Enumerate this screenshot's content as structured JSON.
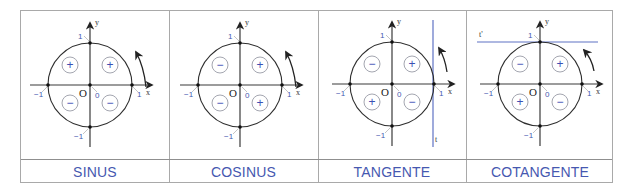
{
  "panels": [
    {
      "label": "SINUS",
      "signs": {
        "top_left": "+",
        "top_right": "+",
        "bottom_left": "−",
        "bottom_right": "−"
      },
      "axis_labels": {
        "x": "x",
        "y": "y",
        "origin": "O",
        "zero": "0",
        "x_pos": "1",
        "x_neg": "−1",
        "y_pos": "1",
        "y_neg": "−1"
      },
      "auxiliary_line": null
    },
    {
      "label": "COSINUS",
      "signs": {
        "top_left": "−",
        "top_right": "+",
        "bottom_left": "−",
        "bottom_right": "+"
      },
      "axis_labels": {
        "x": "x",
        "y": "y",
        "origin": "O",
        "zero": "0",
        "x_pos": "1",
        "x_neg": "−1",
        "y_pos": "1",
        "y_neg": "−1"
      },
      "auxiliary_line": null
    },
    {
      "label": "TANGENTE",
      "signs": {
        "top_left": "−",
        "top_right": "+",
        "bottom_left": "+",
        "bottom_right": "−"
      },
      "axis_labels": {
        "x": "x",
        "y": "y",
        "origin": "O",
        "zero": "0",
        "x_pos": "1",
        "x_neg": "−1",
        "y_pos": "1",
        "y_neg": "−1"
      },
      "auxiliary_line": {
        "name": "t",
        "orientation": "vertical",
        "position": "x=1"
      }
    },
    {
      "label": "COTANGENTE",
      "signs": {
        "top_left": "−",
        "top_right": "+",
        "bottom_left": "+",
        "bottom_right": "−"
      },
      "axis_labels": {
        "x": "x",
        "y": "y",
        "origin": "O",
        "zero": "0",
        "x_pos": "1",
        "x_neg": "−1",
        "y_pos": "1",
        "y_neg": "−1"
      },
      "auxiliary_line": {
        "name": "t'",
        "orientation": "horizontal",
        "position": "y=1"
      }
    }
  ],
  "colors": {
    "label_text": "#4658b0",
    "sign_glyph": "#3c4fb4",
    "tangent_line": "#5f72c4",
    "border": "#a9a9a9"
  }
}
